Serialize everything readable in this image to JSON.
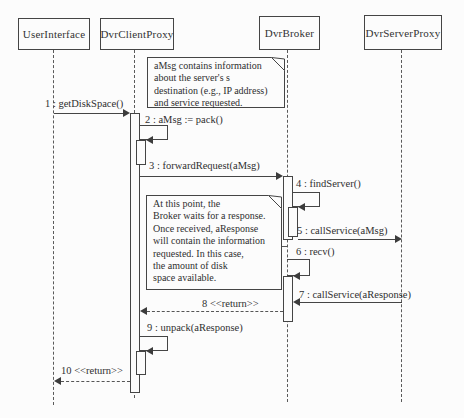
{
  "diagram": {
    "type": "uml-sequence-diagram",
    "colors": {
      "line": "#454545",
      "text": "#2f2f2f",
      "background": "#fcfcfc"
    },
    "lifelines": [
      {
        "id": "user-interface",
        "label": "UserInterface"
      },
      {
        "id": "dvr-client-proxy",
        "label": "DvrClientProxy"
      },
      {
        "id": "dvr-broker",
        "label": "DvrBroker"
      },
      {
        "id": "dvr-server-proxy",
        "label": "DvrServerProxy"
      }
    ],
    "messages": [
      {
        "num": 1,
        "label": "1 : getDiskSpace()",
        "from": "UserInterface",
        "to": "DvrClientProxy",
        "kind": "sync"
      },
      {
        "num": 2,
        "label": "2 : aMsg := pack()",
        "from": "DvrClientProxy",
        "to": "DvrClientProxy",
        "kind": "self"
      },
      {
        "num": 3,
        "label": "3 : forwardRequest(aMsg)",
        "from": "DvrClientProxy",
        "to": "DvrBroker",
        "kind": "sync"
      },
      {
        "num": 4,
        "label": "4 : findServer()",
        "from": "DvrBroker",
        "to": "DvrBroker",
        "kind": "self"
      },
      {
        "num": 5,
        "label": "5 : callService(aMsg)",
        "from": "DvrBroker",
        "to": "DvrServerProxy",
        "kind": "sync"
      },
      {
        "num": 6,
        "label": "6 : recv()",
        "from": "DvrBroker",
        "to": "DvrBroker",
        "kind": "self"
      },
      {
        "num": 7,
        "label": "7 : callService(aResponse)",
        "from": "DvrServerProxy",
        "to": "DvrBroker",
        "kind": "sync"
      },
      {
        "num": 8,
        "label": "8 <<return>>",
        "from": "DvrBroker",
        "to": "DvrClientProxy",
        "kind": "return"
      },
      {
        "num": 9,
        "label": "9 : unpack(aResponse)",
        "from": "DvrClientProxy",
        "to": "DvrClientProxy",
        "kind": "self"
      },
      {
        "num": 10,
        "label": "10 <<return>>",
        "from": "DvrClientProxy",
        "to": "UserInterface",
        "kind": "return"
      }
    ],
    "notes": [
      {
        "id": "note-amsg",
        "lines": [
          "aMsg contains information",
          "about the server's s",
          "destination (e.g., IP address)",
          "and service requested."
        ]
      },
      {
        "id": "note-broker-wait",
        "lines": [
          "At this point, the",
          "Broker waits for a response.",
          "Once received, aResponse",
          "will contain the information",
          "requested. In this case,",
          "the amount of disk",
          "space available."
        ]
      }
    ]
  }
}
